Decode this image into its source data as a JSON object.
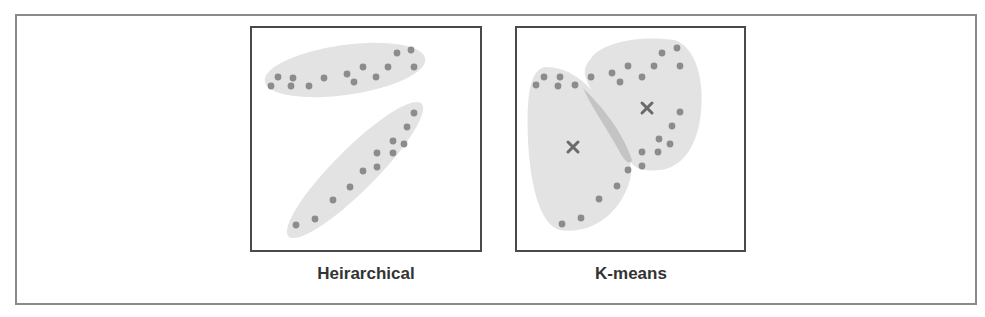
{
  "figure": {
    "panels": [
      {
        "id": "hierarchical",
        "caption": "Heirarchical",
        "frame": {
          "x": 251,
          "y": 27,
          "w": 230,
          "h": 224
        },
        "hulls": [
          {
            "cx": 345,
            "cy": 70,
            "rx": 81,
            "ry": 25,
            "rotate": -8
          },
          {
            "cx": 355,
            "cy": 170,
            "rx": 94,
            "ry": 21,
            "rotate": -45
          }
        ],
        "points": [
          [
            278,
            77
          ],
          [
            271,
            86
          ],
          [
            291,
            86
          ],
          [
            293,
            78
          ],
          [
            309,
            86
          ],
          [
            324,
            78
          ],
          [
            347,
            74
          ],
          [
            354,
            82
          ],
          [
            363,
            67
          ],
          [
            376,
            77
          ],
          [
            388,
            67
          ],
          [
            397,
            53
          ],
          [
            411,
            50
          ],
          [
            414,
            67
          ],
          [
            414,
            113
          ],
          [
            407,
            127
          ],
          [
            393,
            141
          ],
          [
            404,
            144
          ],
          [
            377,
            153
          ],
          [
            393,
            153
          ],
          [
            377,
            167
          ],
          [
            363,
            171
          ],
          [
            350,
            187
          ],
          [
            333,
            200
          ],
          [
            315,
            219
          ],
          [
            296,
            225
          ]
        ],
        "centroids": []
      },
      {
        "id": "kmeans",
        "caption": "K-means",
        "frame": {
          "x": 516,
          "y": 27,
          "w": 229,
          "h": 224
        },
        "hull_paths": [
          "M 545 67 C 530 70 526 95 528 140 C 530 185 540 225 560 230 C 590 235 620 215 630 180 C 635 160 620 130 600 100 C 585 80 565 66 545 67 Z",
          "M 590 60 C 600 42 640 35 675 40 C 700 50 705 90 700 120 C 695 150 680 168 660 170 C 640 172 630 168 625 150 C 615 120 590 95 585 75 C 584 70 586 64 590 60 Z"
        ],
        "overlap_path": "M 583 88 C 595 100 620 125 632 160 C 630 165 626 162 622 156 C 608 130 592 108 583 88 Z",
        "points": [
          [
            544,
            77
          ],
          [
            536,
            85
          ],
          [
            560,
            77
          ],
          [
            558,
            86
          ],
          [
            575,
            85
          ],
          [
            591,
            77
          ],
          [
            612,
            73
          ],
          [
            620,
            82
          ],
          [
            628,
            66
          ],
          [
            642,
            77
          ],
          [
            654,
            66
          ],
          [
            662,
            53
          ],
          [
            677,
            48
          ],
          [
            680,
            66
          ],
          [
            680,
            112
          ],
          [
            672,
            126
          ],
          [
            659,
            139
          ],
          [
            670,
            144
          ],
          [
            642,
            152
          ],
          [
            658,
            152
          ],
          [
            642,
            166
          ],
          [
            628,
            170
          ],
          [
            617,
            186
          ],
          [
            599,
            199
          ],
          [
            581,
            218
          ],
          [
            562,
            224
          ]
        ],
        "centroids": [
          [
            573,
            147
          ],
          [
            647,
            108
          ]
        ],
        "centroid_glyph": "x"
      }
    ],
    "colors": {
      "hull_fill": "#e3e3e3",
      "overlap_fill": "#c4c4c4",
      "point_fill": "#8c8c8c",
      "centroid": "#6a6a6a",
      "frame_stroke": "#4a4a4a",
      "outer_stroke": "#8a8a8a",
      "caption": "#333333"
    }
  }
}
